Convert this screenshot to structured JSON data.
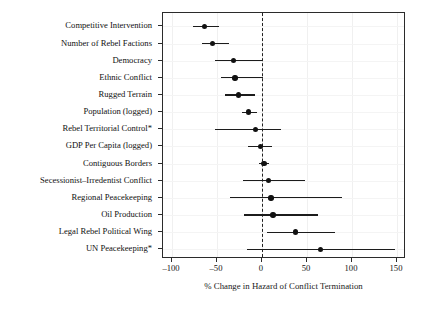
{
  "chart_data": {
    "type": "scatter",
    "title": "",
    "subtitle": "",
    "xlabel": "% Change in Hazard of Conflict Termination",
    "ylabel": "",
    "xlim": [
      -110,
      160
    ],
    "xticks": [
      -100,
      -50,
      0,
      50,
      100,
      150
    ],
    "xtick_labels": [
      "–100",
      "–50",
      "0",
      "50",
      "100",
      "150"
    ],
    "grid": true,
    "legend": null,
    "reference_line": {
      "value": 0,
      "style": "dashed"
    },
    "categories": [
      "Competitive Intervention",
      "Number of Rebel Factions",
      "Democracy",
      "Ethnic Conflict",
      "Rugged Terrain",
      "Population (logged)",
      "Rebel Territorial Control*",
      "GDP Per Capita (logged)",
      "Contiguous Borders",
      "Secessionist–Irredentist Conflict",
      "Regional Peacekeeping",
      "Oil Production",
      "Legal Rebel Political Wing",
      "UN Peacekeeping*"
    ],
    "points": [
      {
        "label": "Competitive Intervention",
        "estimate": -64,
        "ci_low": -77,
        "ci_high": -48
      },
      {
        "label": "Number of Rebel Factions",
        "estimate": -55,
        "ci_low": -67,
        "ci_high": -37
      },
      {
        "label": "Democracy",
        "estimate": -32,
        "ci_low": -52,
        "ci_high": 0
      },
      {
        "label": "Ethnic Conflict",
        "estimate": -30,
        "ci_low": -46,
        "ci_high": 1
      },
      {
        "label": "Rugged Terrain",
        "estimate": -26,
        "ci_low": -41,
        "ci_high": -8
      },
      {
        "label": "Population (logged)",
        "estimate": -15,
        "ci_low": -22,
        "ci_high": -6
      },
      {
        "label": "Rebel Territorial Control*",
        "estimate": -7,
        "ci_low": -52,
        "ci_high": 21
      },
      {
        "label": "GDP Per Capita (logged)",
        "estimate": -2,
        "ci_low": -16,
        "ci_high": 11
      },
      {
        "label": "Contiguous Borders",
        "estimate": 2,
        "ci_low": -3,
        "ci_high": 8
      },
      {
        "label": "Secessionist–Irredentist Conflict",
        "estimate": 7,
        "ci_low": -21,
        "ci_high": 48
      },
      {
        "label": "Regional Peacekeeping",
        "estimate": 10,
        "ci_low": -36,
        "ci_high": 89
      },
      {
        "label": "Oil Production",
        "estimate": 12,
        "ci_low": -20,
        "ci_high": 62
      },
      {
        "label": "Legal Rebel Political Wing",
        "estimate": 37,
        "ci_low": 6,
        "ci_high": 81
      },
      {
        "label": "UN Peacekeeping*",
        "estimate": 65,
        "ci_low": -17,
        "ci_high": 148
      }
    ],
    "colors": {
      "point": "#111111",
      "interval": "#1c1c1c",
      "frame": "#2b2b2b",
      "grid": "#f0f0f0",
      "reference": "#222222",
      "background": "#ffffff"
    }
  }
}
